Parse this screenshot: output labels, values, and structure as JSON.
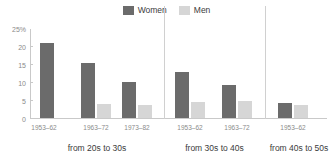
{
  "chart_data": {
    "type": "bar",
    "title": "",
    "subtitle": "",
    "xlabel": "",
    "ylabel": "",
    "ylim": [
      0,
      25
    ],
    "ytick_labels": [
      "0",
      "5",
      "10",
      "15",
      "20",
      "25%"
    ],
    "ytick_values": [
      0,
      5,
      10,
      15,
      20,
      25
    ],
    "grid": false,
    "legend_position": "top-center",
    "legend": [
      {
        "name": "Women",
        "color": "#6b6b6b"
      },
      {
        "name": "Men",
        "color": "#d6d6d6"
      }
    ],
    "series": [
      {
        "name": "Women",
        "color": "#6b6b6b",
        "values": [
          21.2,
          15.5,
          10.1,
          12.8,
          9.2,
          4.2
        ]
      },
      {
        "name": "Men",
        "color": "#d6d6d6",
        "values": [
          null,
          4.0,
          3.7,
          4.5,
          4.8,
          3.6
        ]
      }
    ],
    "categories": [
      "1953–62",
      "1963–72",
      "1973–82",
      "1953–62",
      "1963–72",
      "1953–62"
    ],
    "panels": [
      {
        "label": "from 20s to 30s",
        "categories": [
          "1953–62",
          "1963–72",
          "1973–82"
        ],
        "women": [
          21.2,
          15.5,
          10.1
        ],
        "men": [
          null,
          4.0,
          3.7
        ]
      },
      {
        "label": "from 30s to 40s",
        "categories": [
          "1953–62",
          "1963–72"
        ],
        "women": [
          12.8,
          9.2
        ],
        "men": [
          4.5,
          4.8
        ]
      },
      {
        "label": "from 40s to 50s",
        "categories": [
          "1953–62"
        ],
        "women": [
          4.2
        ],
        "men": [
          3.6
        ]
      }
    ]
  },
  "colors": {
    "women": "#6b6b6b",
    "men": "#d6d6d6",
    "axis": "#c9c9c9",
    "divider": "#d0d0d0",
    "tick_text": "#8a8a8a",
    "label_text": "#3b3b3b",
    "background": "#ffffff"
  }
}
